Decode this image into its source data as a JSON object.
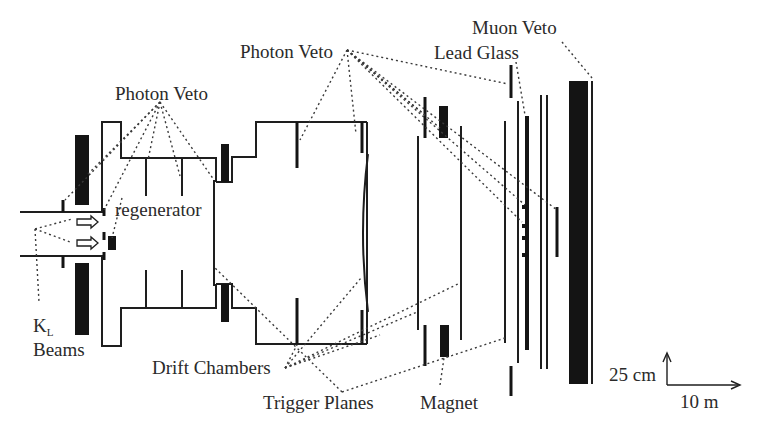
{
  "figure": {
    "type": "detector-schematic",
    "background": "#ffffff",
    "ink": "#1e1e1e"
  },
  "labels": {
    "photon_veto_left": "Photon Veto",
    "photon_veto_right": "Photon Veto",
    "regenerator": "regenerator",
    "kl_main": "K",
    "kl_sub": "L",
    "beams": "Beams",
    "drift_chambers": "Drift Chambers",
    "trigger_planes": "Trigger Planes",
    "magnet": "Magnet",
    "lead_glass": "Lead Glass",
    "muon_veto": "Muon Veto"
  },
  "scale": {
    "vertical": "25 cm",
    "horizontal": "10 m"
  },
  "components": [
    {
      "name": "KL beams",
      "count": 2
    },
    {
      "name": "regenerator"
    },
    {
      "name": "photon veto",
      "count": "multiple"
    },
    {
      "name": "drift chambers",
      "count": 4
    },
    {
      "name": "magnet"
    },
    {
      "name": "trigger planes",
      "count": 2
    },
    {
      "name": "lead glass calorimeter"
    },
    {
      "name": "muon veto"
    }
  ]
}
